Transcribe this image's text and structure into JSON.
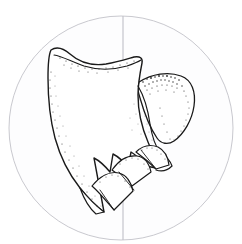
{
  "figure": {
    "caption_fragment": "· · · — · ·",
    "background_color": "#ffffff",
    "ink_color": "#1a1a1a",
    "stipple_color": "#2b2b2b",
    "field_circle": {
      "label": "microscope-field-circle",
      "center_x": 121,
      "center_y": 128,
      "radius": 112,
      "stroke_color": "#c9c9cf",
      "stroke_width": 1,
      "fill_color": "#fdfdfe"
    },
    "axis_line": {
      "label": "vertical-reference-line",
      "x": 123,
      "y_top": 17,
      "y_bottom": 238,
      "stroke_color": "#b9b9c2",
      "stroke_width": 1
    },
    "specimen": {
      "label": "specimen-outline",
      "description": "Elongate denticulate element with anterior hook, broad blade and three posterior denticles, plus a lateral teardrop-shaped lobe",
      "outline_stroke": "#1a1a1a",
      "outline_width": 1.4,
      "fill_color": "#ffffff",
      "parts": [
        {
          "name": "anterior-cusp-hook",
          "shading": "light-stipple"
        },
        {
          "name": "main-blade",
          "shading": "none"
        },
        {
          "name": "lateral-lobe",
          "shading": "dense-stipple-crest"
        },
        {
          "name": "denticle-1",
          "shading": "light-stipple"
        },
        {
          "name": "denticle-2",
          "shading": "light-stipple"
        },
        {
          "name": "denticle-3",
          "shading": "light-stipple"
        },
        {
          "name": "basal-margin",
          "shading": "dotted-margin"
        }
      ]
    }
  }
}
